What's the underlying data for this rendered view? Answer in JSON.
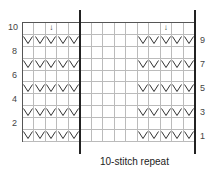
{
  "chart": {
    "columns": 15,
    "rows": 10,
    "repeat_columns_start": 6,
    "repeat_columns_end": 15,
    "repeat_label": "10-stitch repeat",
    "left_row_numbers": [
      "10",
      "8",
      "6",
      "4",
      "2"
    ],
    "right_row_numbers": [
      "9",
      "7",
      "5",
      "3",
      "1"
    ],
    "symbol_rows": [
      1,
      3,
      5,
      7,
      9
    ],
    "symbol_columns": [
      1,
      2,
      3,
      4,
      5,
      11,
      12,
      13,
      14,
      15
    ],
    "symbol": "slip-stitch-v",
    "arrows": [
      {
        "row": 10,
        "column": 3
      },
      {
        "row": 10,
        "column": 13
      }
    ],
    "arrow_glyph": "↓"
  }
}
